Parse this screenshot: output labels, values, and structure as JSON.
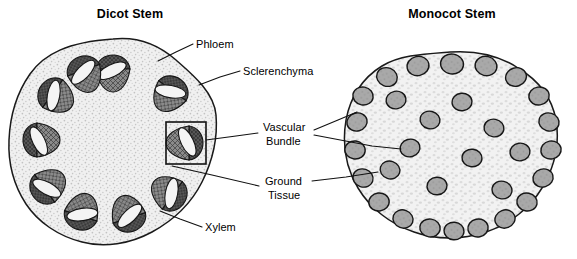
{
  "figure": {
    "kind": "botany-cross-section-diagram",
    "background_color": "#ffffff",
    "ink_color": "#1a1a1a"
  },
  "titles": {
    "dicot": "Dicot Stem",
    "monocot": "Monocot Stem"
  },
  "labels": {
    "phloem": "Phloem",
    "sclerenchyma": "Sclerenchyma",
    "vascular_bundle_line1": "Vascular",
    "vascular_bundle_line2": "Bundle",
    "ground_tissue_line1": "Ground",
    "ground_tissue_line2": "Tissue",
    "xylem": "Xylem"
  },
  "colors": {
    "outline": "#1a1a1a",
    "ground_tissue_fill": "#efefef",
    "stipple": "#b9b9b9",
    "sclerenchyma_fill": "#5e5e5e",
    "xylem_fill": "#8d8d8d",
    "phloem_fill": "#f3f3f3",
    "monocot_bundle_fill": "#a8a8a8",
    "leader": "#111111"
  },
  "dicot_stem": {
    "center_x": 113,
    "center_y": 143,
    "radius": 104,
    "bundle_count": 10,
    "bundle_ring_radius": 72,
    "description": "Ring of vascular bundles in ground tissue"
  },
  "monocot_stem": {
    "center_x": 450,
    "center_y": 150,
    "radius": 98,
    "bundle_count": 30,
    "description": "Scattered vascular bundles throughout ground tissue"
  },
  "dicot_bundles": [
    {
      "angle": -90,
      "r": 70
    },
    {
      "angle": -54,
      "r": 70
    },
    {
      "angle": -18,
      "r": 71
    },
    {
      "angle": 18,
      "r": 70
    },
    {
      "angle": 54,
      "r": 69
    },
    {
      "angle": 90,
      "r": 70
    },
    {
      "angle": 126,
      "r": 70
    },
    {
      "angle": 162,
      "r": 71
    },
    {
      "angle": 198,
      "r": 70
    },
    {
      "angle": 234,
      "r": 70
    }
  ],
  "highlighted_bundle": {
    "angle": 0,
    "note": "boxed vascular bundle on right side of dicot"
  },
  "monocot_bundles": [
    {
      "x": 452,
      "y": 62,
      "rx": 11,
      "ry": 10
    },
    {
      "x": 418,
      "y": 64,
      "rx": 11,
      "ry": 10
    },
    {
      "x": 486,
      "y": 64,
      "rx": 11,
      "ry": 10
    },
    {
      "x": 386,
      "y": 74,
      "rx": 10,
      "ry": 9
    },
    {
      "x": 516,
      "y": 74,
      "rx": 10,
      "ry": 9
    },
    {
      "x": 360,
      "y": 90,
      "rx": 10,
      "ry": 9
    },
    {
      "x": 538,
      "y": 92,
      "rx": 10,
      "ry": 9
    },
    {
      "x": 368,
      "y": 114,
      "rx": 10,
      "ry": 9
    },
    {
      "x": 548,
      "y": 116,
      "rx": 10,
      "ry": 9
    },
    {
      "x": 359,
      "y": 136,
      "rx": 10,
      "ry": 9
    },
    {
      "x": 553,
      "y": 142,
      "rx": 10,
      "ry": 9
    },
    {
      "x": 364,
      "y": 160,
      "rx": 10,
      "ry": 9
    },
    {
      "x": 546,
      "y": 168,
      "rx": 10,
      "ry": 9
    },
    {
      "x": 374,
      "y": 186,
      "rx": 10,
      "ry": 9
    },
    {
      "x": 532,
      "y": 190,
      "rx": 10,
      "ry": 9
    },
    {
      "x": 396,
      "y": 206,
      "rx": 10,
      "ry": 9
    },
    {
      "x": 512,
      "y": 210,
      "rx": 10,
      "ry": 9
    },
    {
      "x": 424,
      "y": 220,
      "rx": 10,
      "ry": 9
    },
    {
      "x": 486,
      "y": 222,
      "rx": 10,
      "ry": 9
    },
    {
      "x": 455,
      "y": 226,
      "rx": 10,
      "ry": 9
    },
    {
      "x": 410,
      "y": 142,
      "rx": 10,
      "ry": 9
    },
    {
      "x": 456,
      "y": 100,
      "rx": 10,
      "ry": 9
    },
    {
      "x": 492,
      "y": 126,
      "rx": 10,
      "ry": 9
    },
    {
      "x": 430,
      "y": 118,
      "rx": 10,
      "ry": 9
    },
    {
      "x": 470,
      "y": 156,
      "rx": 10,
      "ry": 9
    },
    {
      "x": 432,
      "y": 180,
      "rx": 10,
      "ry": 9
    },
    {
      "x": 500,
      "y": 186,
      "rx": 10,
      "ry": 9
    },
    {
      "x": 398,
      "y": 96,
      "rx": 10,
      "ry": 9
    },
    {
      "x": 520,
      "y": 148,
      "rx": 10,
      "ry": 9
    },
    {
      "x": 390,
      "y": 166,
      "rx": 10,
      "ry": 9
    }
  ],
  "label_positions": {
    "dicot_title": {
      "x": 130,
      "y": 17
    },
    "monocot_title": {
      "x": 452,
      "y": 17
    },
    "phloem": {
      "x": 196,
      "y": 48
    },
    "sclerenchyma": {
      "x": 243,
      "y": 75
    },
    "vascular_bundle": {
      "x": 263,
      "y": 131
    },
    "ground_tissue": {
      "x": 264,
      "y": 185
    },
    "xylem": {
      "x": 205,
      "y": 231
    }
  },
  "leader_lines": [
    {
      "name": "phloem-leader",
      "points": "193,44 176,52 161,60"
    },
    {
      "name": "sclerenchyma-leader",
      "points": "240,71 221,77 200,84"
    },
    {
      "name": "vascular-bundle-leader-dicot",
      "points": "258,133 238,137 222,138"
    },
    {
      "name": "vascular-bundle-leader-mono-1",
      "points": "314,130 340,122 362,113"
    },
    {
      "name": "vascular-bundle-leader-mono-2",
      "points": "314,134 370,146 410,150"
    },
    {
      "name": "ground-tissue-leader-dicot",
      "points": "259,186 210,175 175,167"
    },
    {
      "name": "ground-tissue-leader-mono",
      "points": "312,181 345,177 378,172"
    },
    {
      "name": "xylem-leader",
      "points": "202,227 180,219 163,212"
    }
  ]
}
